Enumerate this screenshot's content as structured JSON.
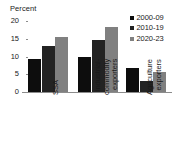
{
  "chart_data": {
    "type": "bar",
    "title": "",
    "subtitle": "",
    "xlabel": "",
    "ylabel": "Percent",
    "ylim": [
      0,
      20
    ],
    "yticks": [
      0,
      5,
      10,
      15,
      20
    ],
    "grid": false,
    "legend_position": "top-right",
    "categories": [
      "SSA",
      "Industrial-commodity exporters",
      "Agriculture exporters"
    ],
    "category_lines": [
      [
        "SSA"
      ],
      [
        "Industrial-",
        "commodity",
        "exporters"
      ],
      [
        "Agriculture",
        "exporters"
      ]
    ],
    "series": [
      {
        "name": "2000-09",
        "color": "#0d0d0d",
        "values": [
          9.3,
          10.0,
          6.7
        ]
      },
      {
        "name": "2010-19",
        "color": "#232323",
        "values": [
          13.1,
          14.7,
          3.1
        ]
      },
      {
        "name": "2020-23",
        "color": "#808080",
        "values": [
          15.5,
          18.2,
          5.7
        ]
      }
    ]
  },
  "legend": {
    "entries": [
      {
        "label": "2000-09",
        "color": "#0d0d0d"
      },
      {
        "label": "2010-19",
        "color": "#232323"
      },
      {
        "label": "2020-23",
        "color": "#808080"
      }
    ]
  },
  "axis": {
    "unit_label": "Percent",
    "tick_labels": [
      "20",
      "15",
      "10",
      "5",
      "0"
    ],
    "axis_color": "#8c8c8c"
  }
}
